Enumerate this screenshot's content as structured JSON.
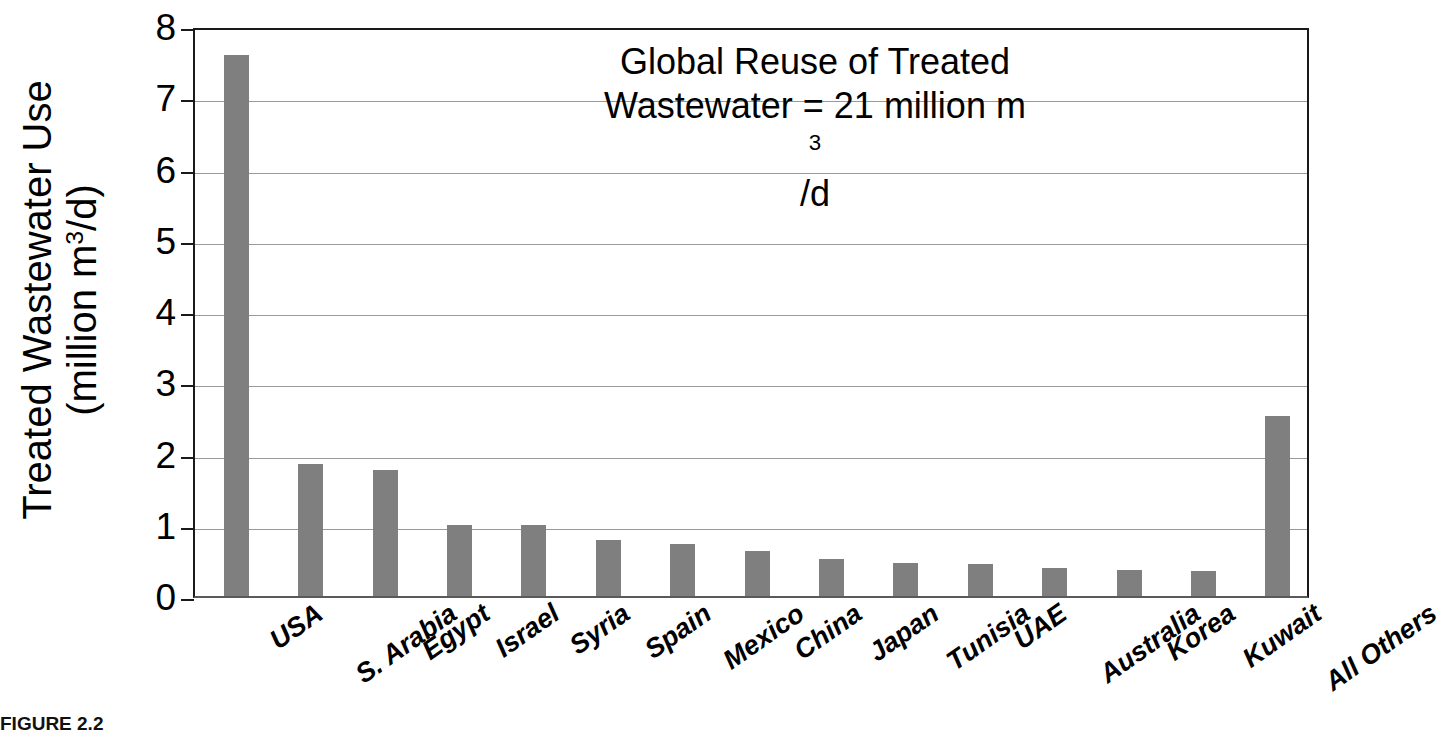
{
  "chart_data": {
    "type": "bar",
    "title": "",
    "xlabel": "",
    "ylabel": "Treated Wastewater Use (million m3/d)",
    "ylabel_line1": "Treated Wastewater Use",
    "ylabel_line2_prefix": "(million m",
    "ylabel_line2_sup": "3",
    "ylabel_line2_suffix": "/d)",
    "ylim": [
      0,
      8
    ],
    "ytick_labels": [
      "8",
      "7",
      "6",
      "5",
      "4",
      "3",
      "2",
      "1",
      "0"
    ],
    "ytick_values": [
      8,
      7,
      6,
      5,
      4,
      3,
      2,
      1,
      0
    ],
    "grid": "horizontal",
    "legend_position": "none",
    "bar_color": "#7f7f7f",
    "axis_color": "#1a1a1a",
    "gridline_color": "#9a9a9a",
    "categories": [
      "USA",
      "S. Arabia",
      "Egypt",
      "Israel",
      "Syria",
      "Spain",
      "Mexico",
      "China",
      "Japan",
      "Tunisia",
      "UAE",
      "Australia",
      "Korea",
      "Kuwait",
      "All Others"
    ],
    "values": [
      7.6,
      1.85,
      1.77,
      1.0,
      1.0,
      0.79,
      0.73,
      0.63,
      0.52,
      0.46,
      0.45,
      0.4,
      0.36,
      0.35,
      2.53
    ],
    "annotation": {
      "line1": "Global Reuse of Treated",
      "line2_prefix": "Wastewater = 21 million m",
      "line2_sup": "3",
      "line2_suffix": "/d",
      "full_text": "Global Reuse of Treated Wastewater = 21 million m3/d"
    }
  },
  "caption": {
    "text": "FIGURE 2.2"
  }
}
